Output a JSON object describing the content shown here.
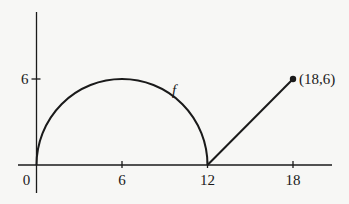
{
  "chart_data": {
    "type": "line",
    "title": "",
    "xlabel": "",
    "ylabel": "",
    "xlim": [
      -0.3,
      19.2
    ],
    "ylim": [
      -1,
      8.8
    ],
    "x_ticks": [
      {
        "value": 0,
        "label": "0"
      },
      {
        "value": 6,
        "label": "6"
      },
      {
        "value": 12,
        "label": "12"
      },
      {
        "value": 18,
        "label": "18"
      }
    ],
    "y_ticks": [
      {
        "value": 6,
        "label": "6"
      }
    ],
    "series": [
      {
        "name": "f",
        "segments": [
          {
            "kind": "semicircle",
            "center": [
              6,
              0
            ],
            "radius": 6,
            "from": [
              0,
              0
            ],
            "to": [
              12,
              0
            ]
          },
          {
            "kind": "line",
            "from": [
              12,
              0
            ],
            "to": [
              18,
              6
            ]
          }
        ]
      }
    ],
    "curve_label": {
      "text": "f",
      "x": 9.5,
      "y": 4.9
    },
    "annotations": [
      {
        "text": "(18,6)",
        "x": 18,
        "y": 6,
        "marker": "dot"
      }
    ],
    "grid": false,
    "legend": "none"
  }
}
